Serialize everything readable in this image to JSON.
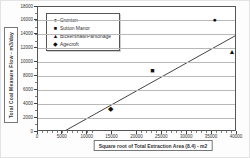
{
  "figure": {
    "type_note": "scanned scatter chart"
  },
  "chart_data": {
    "type": "scatter",
    "title": "",
    "xlabel": "Square root of Total Extraction Area (8.4) - m2",
    "ylabel": "Total Coal Measure Flow - m3/day",
    "xlim": [
      0,
      40000
    ],
    "ylim": [
      0,
      18000
    ],
    "x_ticks": [
      0,
      5000,
      10000,
      15000,
      20000,
      25000,
      30000,
      35000,
      40000
    ],
    "y_ticks": [
      0,
      2000,
      4000,
      6000,
      8000,
      10000,
      12000,
      14000,
      16000,
      18000
    ],
    "grid": "horizontal",
    "legend_position": "top-left-inside",
    "series": [
      {
        "name": "Cronton",
        "marker": "circle",
        "points": [
          [
            35500,
            16300
          ]
        ]
      },
      {
        "name": "Sutton Manor",
        "marker": "square",
        "points": [
          [
            23000,
            8900
          ]
        ]
      },
      {
        "name": "Bickershaw/Parsonage",
        "marker": "triangle",
        "points": [
          [
            39000,
            11600
          ]
        ]
      },
      {
        "name": "Agecroft",
        "marker": "diamond",
        "points": [
          [
            14600,
            3400
          ]
        ]
      }
    ],
    "trendline": {
      "x1": 5000,
      "y1": 0,
      "x2": 40000,
      "y2": 14000
    }
  }
}
